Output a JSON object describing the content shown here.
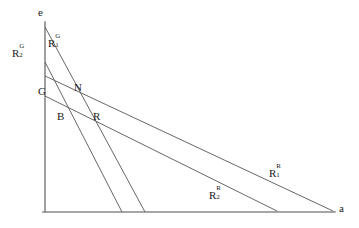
{
  "figure": {
    "type": "line-diagram",
    "background": "#ffffff",
    "line_color": "#555555",
    "axis_color": "#888888",
    "text_color": "#1a1a1a",
    "width": 359,
    "height": 228
  },
  "axes": {
    "y_axis_label": "e",
    "x_axis_label": "a",
    "origin": {
      "x": 45,
      "y": 212
    },
    "y_top": {
      "x": 45,
      "y": 22
    },
    "x_right": {
      "x": 335,
      "y": 212
    }
  },
  "curve_labels": [
    {
      "id": "R1G",
      "base": "R",
      "sub": "1",
      "sup": "G",
      "x": 48,
      "y": 36
    },
    {
      "id": "R2G",
      "base": "R",
      "sub": "2",
      "sup": "G",
      "x": 12,
      "y": 46
    },
    {
      "id": "R1R",
      "base": "R",
      "sub": "1",
      "sup": "R",
      "x": 269,
      "y": 166
    },
    {
      "id": "R2R",
      "base": "R",
      "sub": "2",
      "sup": "R",
      "x": 209,
      "y": 188
    }
  ],
  "point_labels": [
    {
      "id": "G",
      "text": "G",
      "x": 38,
      "y": 86
    },
    {
      "id": "N",
      "text": "N",
      "x": 74,
      "y": 82
    },
    {
      "id": "B",
      "text": "B",
      "x": 57,
      "y": 111
    },
    {
      "id": "R",
      "text": "R",
      "x": 93,
      "y": 111
    }
  ],
  "lines": [
    {
      "id": "R1G",
      "name": "steep-line-R1G",
      "from": {
        "x": 45,
        "y": 27
      },
      "to": {
        "x": 145,
        "y": 212
      }
    },
    {
      "id": "R2G",
      "name": "steep-line-R2G",
      "from": {
        "x": 45,
        "y": 62
      },
      "to": {
        "x": 122,
        "y": 212
      }
    },
    {
      "id": "R1R",
      "name": "shallow-line-R1R",
      "from": {
        "x": 45,
        "y": 76
      },
      "to": {
        "x": 333,
        "y": 211
      }
    },
    {
      "id": "R2R",
      "name": "shallow-line-R2R",
      "from": {
        "x": 45,
        "y": 96
      },
      "to": {
        "x": 277,
        "y": 211
      }
    }
  ]
}
